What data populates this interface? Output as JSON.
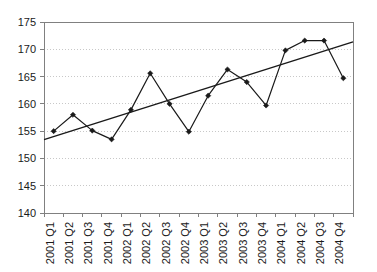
{
  "chart_data": {
    "type": "line",
    "title": "",
    "xlabel": "",
    "ylabel": "",
    "categories": [
      "2001 Q1",
      "2001 Q2",
      "2001 Q3",
      "2001 Q4",
      "2002 Q1",
      "2002 Q2",
      "2002 Q3",
      "2002 Q4",
      "2003 Q1",
      "2003 Q2",
      "2003 Q3",
      "2003 Q4",
      "2004 Q1",
      "2004 Q2",
      "2004 Q3",
      "2004 Q4"
    ],
    "series": [
      {
        "name": "Series 1",
        "marker": "diamond",
        "color": "#1a1a1a",
        "values": [
          155.0,
          158.0,
          155.1,
          153.5,
          158.9,
          165.6,
          160.0,
          154.9,
          161.5,
          166.3,
          164.0,
          159.7,
          169.8,
          171.6,
          171.6,
          164.7
        ]
      },
      {
        "name": "Trend",
        "marker": "none",
        "color": "#1a1a1a",
        "values": [
          154.0,
          155.1,
          156.2,
          157.3,
          158.5,
          159.6,
          160.7,
          161.8,
          162.9,
          164.1,
          165.2,
          166.3,
          167.4,
          168.5,
          169.7,
          170.8
        ]
      }
    ],
    "ylim": [
      140,
      175
    ],
    "yticks": [
      140,
      145,
      150,
      155,
      160,
      165,
      170,
      175
    ],
    "ytick_labels": [
      "140",
      "145",
      "150",
      "155",
      "160",
      "165",
      "170",
      "175"
    ],
    "grid": true,
    "grid_color": "#c8c8c8",
    "legend": "none",
    "axis_color": "#808080"
  }
}
